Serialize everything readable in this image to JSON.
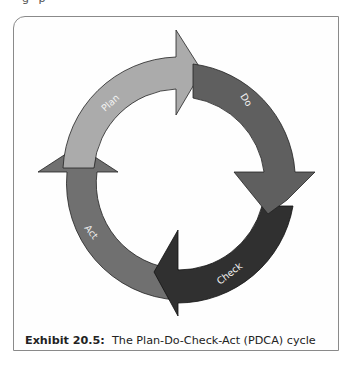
{
  "page": {
    "top_fragment": "g  p"
  },
  "diagram": {
    "title": "Plan-Do-Check-Act (PDCA) cycle",
    "stages": [
      {
        "label": "Plan",
        "color": "#a9a9a9"
      },
      {
        "label": "Do",
        "color": "#5e5e5e"
      },
      {
        "label": "Check",
        "color": "#2f2f2f"
      },
      {
        "label": "Act",
        "color": "#6f6f6f"
      }
    ],
    "stroke_color": "#222222"
  },
  "caption": {
    "number": "Exhibit 20.5:",
    "text": "The Plan-Do-Check-Act (PDCA) cycle"
  }
}
